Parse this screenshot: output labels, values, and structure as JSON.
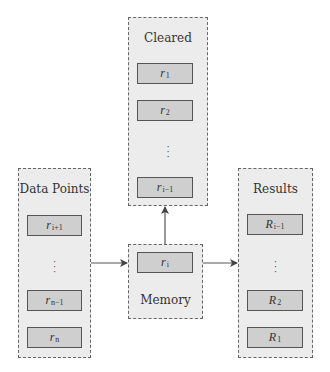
{
  "diagram": {
    "containers": {
      "cleared": {
        "title": "Cleared",
        "items": [
          {
            "base": "r",
            "sub": "1"
          },
          {
            "base": "r",
            "sub": "2"
          },
          {
            "ellipsis": "⋮"
          },
          {
            "base": "r",
            "sub": "i−1"
          }
        ]
      },
      "data_points": {
        "title": "Data Points",
        "items": [
          {
            "base": "r",
            "sub": "i+1"
          },
          {
            "ellipsis": "⋮"
          },
          {
            "base": "r",
            "sub": "n−1"
          },
          {
            "base": "r",
            "sub": "n"
          }
        ]
      },
      "memory": {
        "title": "Memory",
        "items": [
          {
            "base": "r",
            "sub": "i"
          }
        ]
      },
      "results": {
        "title": "Results",
        "items": [
          {
            "base": "R",
            "sub": "i−1"
          },
          {
            "ellipsis": "⋮"
          },
          {
            "base": "R",
            "sub": "2"
          },
          {
            "base": "R",
            "sub": "1"
          }
        ]
      }
    },
    "edges": [
      {
        "from": "data_points",
        "to": "memory"
      },
      {
        "from": "memory",
        "to": "results"
      },
      {
        "from": "memory",
        "to": "cleared"
      }
    ],
    "colors": {
      "container_fill": "#ececec",
      "container_border": "#666666",
      "item_fill": "#cfcfcf",
      "item_border": "#555555",
      "arrow": "#444444"
    }
  }
}
